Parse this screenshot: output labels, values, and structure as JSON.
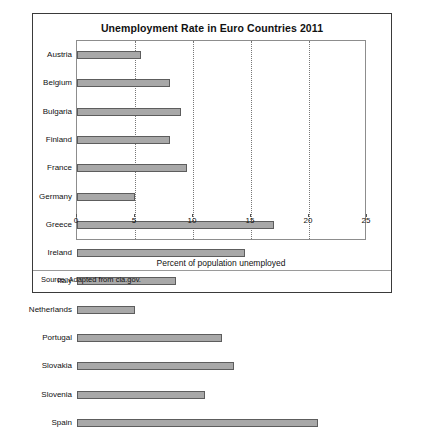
{
  "chart_data": {
    "type": "bar",
    "orientation": "horizontal",
    "title": "Unemployment Rate in Euro Countries 2011",
    "xlabel": "Percent of population unemployed",
    "ylabel": "",
    "xlim": [
      0,
      25
    ],
    "xticks": [
      0,
      5,
      10,
      15,
      20,
      25
    ],
    "gridlines": [
      5,
      10,
      15,
      20
    ],
    "grid": true,
    "legend": null,
    "categories": [
      "Austria",
      "Belgium",
      "Bulgaria",
      "Finland",
      "France",
      "Germany",
      "Greece",
      "Ireland",
      "Italy",
      "Netherlands",
      "Portugal",
      "Slovakia",
      "Slovenia",
      "Spain"
    ],
    "values": [
      5.5,
      8.0,
      9.0,
      8.0,
      9.5,
      5.0,
      17.0,
      14.5,
      8.5,
      5.0,
      12.5,
      13.5,
      11.0,
      20.8
    ],
    "bar_color": "#a8a8a8",
    "bar_edge_color": "#5d5d5d"
  },
  "figure": {
    "title": "Unemployment Rate in Euro Countries 2011",
    "xaxis_label": "Percent of population unemployed",
    "source_note": "Source: Adapted from cia.gov."
  }
}
